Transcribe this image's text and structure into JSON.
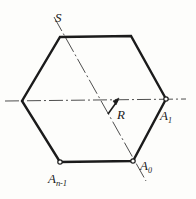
{
  "figure": {
    "background_color": "#fdfdfb",
    "stroke_color": "#1b1b1b",
    "axis_color": "#3a3a3a",
    "labels": {
      "s_axis": "S",
      "radius": "R",
      "vertex_a1": "A",
      "vertex_a1_sub": "1",
      "vertex_a0": "A",
      "vertex_a0_sub": "0",
      "vertex_an1": "A",
      "vertex_an1_sub": "n-1"
    },
    "geometry": {
      "polygon_type": "hexagon",
      "vertices": [
        {
          "name": "top-left",
          "x": 60,
          "y": 37,
          "marker": false
        },
        {
          "name": "top-right",
          "x": 131,
          "y": 36,
          "marker": false
        },
        {
          "name": "right",
          "x": 166,
          "y": 99,
          "marker": true
        },
        {
          "name": "bottom-right",
          "x": 133,
          "y": 161,
          "marker": true
        },
        {
          "name": "bottom-left",
          "x": 60,
          "y": 162,
          "marker": true
        },
        {
          "name": "left",
          "x": 22,
          "y": 101,
          "marker": false
        }
      ],
      "center": {
        "x": 95,
        "y": 100
      },
      "horizontal_axis": {
        "x1": 5,
        "y1": 101,
        "x2": 186,
        "y2": 99
      },
      "s_axis_line": {
        "x1": 54,
        "y1": 17,
        "x2": 146,
        "y2": 181
      },
      "radius_arrow": {
        "x1": 108,
        "y1": 114,
        "x2": 119,
        "y2": 99
      }
    }
  }
}
